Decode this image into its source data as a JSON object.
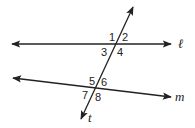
{
  "diagram": {
    "type": "parallel lines cut by a transversal",
    "lines": {
      "l": {
        "label": "ℓ",
        "x1": 12,
        "y1": 44,
        "x2": 171,
        "y2": 44
      },
      "m": {
        "label": "m",
        "x1": 13,
        "y1": 78,
        "x2": 171,
        "y2": 97
      },
      "t": {
        "label": "t",
        "x1": 81,
        "y1": 119,
        "x2": 133,
        "y2": 7
      }
    },
    "angles": [
      {
        "label": "1",
        "x": 110,
        "y": 41
      },
      {
        "label": "2",
        "x": 124,
        "y": 41
      },
      {
        "label": "3",
        "x": 101,
        "y": 55
      },
      {
        "label": "4",
        "x": 117,
        "y": 55
      },
      {
        "label": "5",
        "x": 89,
        "y": 84
      },
      {
        "label": "6",
        "x": 100,
        "y": 85
      },
      {
        "label": "7",
        "x": 82,
        "y": 98
      },
      {
        "label": "8",
        "x": 95,
        "y": 100
      }
    ],
    "stroke_color": "#222222"
  }
}
